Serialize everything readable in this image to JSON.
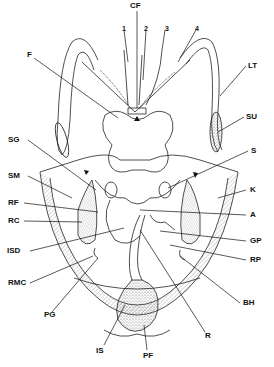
{
  "diagram": {
    "type": "anatomical line drawing",
    "labels": {
      "CF": "CF",
      "n1": "1",
      "n2": "2",
      "n3": "3",
      "n4": "4",
      "F": "F",
      "LT": "LT",
      "SU": "SU",
      "SG": "SG",
      "S": "S",
      "SM": "SM",
      "K": "K",
      "RF": "RF",
      "A": "A",
      "RC": "RC",
      "GP": "GP",
      "ISD": "ISD",
      "RP": "RP",
      "RMC": "RMC",
      "BH": "BH",
      "PG": "PG",
      "R": "R",
      "IS": "IS",
      "PF": "PF"
    }
  }
}
